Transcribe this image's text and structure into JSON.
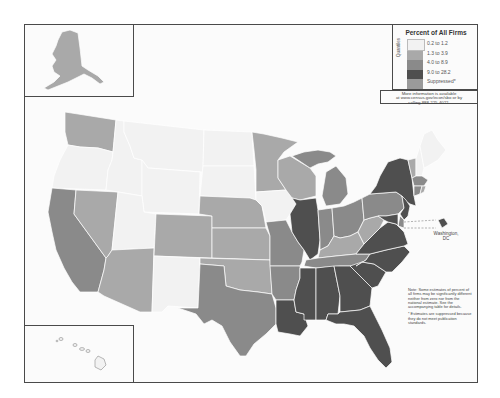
{
  "legend": {
    "title": "Percent of All Firms",
    "axis_label": "Quantiles",
    "classes": [
      {
        "label": "0.2 to 1.2",
        "color": "#f2f2f2"
      },
      {
        "label": "1.3 to 3.9",
        "color": "#a9a9a9"
      },
      {
        "label": "4.0 to 8.9",
        "color": "#8a8a8a"
      },
      {
        "label": "9.0 to 28.2",
        "color": "#4f4f4f"
      },
      {
        "label": "Suppressed*",
        "color": "#9a9a9a"
      }
    ]
  },
  "info_box": {
    "line1": "More information is available",
    "line2": "at www.census.gov/econ/sbo or by",
    "line3": "calling 888-225-4022."
  },
  "notes": {
    "note": "Note: Some estimates of percent of all firms may be significantly different neither from zero nor from the national estimate. See the accompanying table for details.",
    "suppressed": "* Estimates are suppressed because they do not meet publication standards."
  },
  "dc_label": {
    "line1": "Washington,",
    "line2": "DC"
  },
  "colors": {
    "class1": "#f2f2f2",
    "class2": "#a9a9a9",
    "class3": "#8a8a8a",
    "class4": "#4f4f4f",
    "border": "#ffffff",
    "frame": "#4a4a4a"
  },
  "states": {
    "WA": "1.3 to 3.9",
    "OR": "0.2 to 1.2",
    "CA": "4.0 to 8.9",
    "NV": "1.3 to 3.9",
    "ID": "0.2 to 1.2",
    "MT": "0.2 to 1.2",
    "WY": "0.2 to 1.2",
    "UT": "0.2 to 1.2",
    "AZ": "1.3 to 3.9",
    "CO": "1.3 to 3.9",
    "NM": "0.2 to 1.2",
    "ND": "0.2 to 1.2",
    "SD": "0.2 to 1.2",
    "NE": "1.3 to 3.9",
    "KS": "1.3 to 3.9",
    "OK": "1.3 to 3.9",
    "TX": "4.0 to 8.9",
    "MN": "1.3 to 3.9",
    "IA": "0.2 to 1.2",
    "MO": "4.0 to 8.9",
    "AR": "4.0 to 8.9",
    "LA": "9.0 to 28.2",
    "WI": "1.3 to 3.9",
    "IL": "9.0 to 28.2",
    "MI": "4.0 to 8.9",
    "IN": "4.0 to 8.9",
    "OH": "4.0 to 8.9",
    "KY": "1.3 to 3.9",
    "TN": "4.0 to 8.9",
    "MS": "9.0 to 28.2",
    "AL": "9.0 to 28.2",
    "GA": "9.0 to 28.2",
    "FL": "9.0 to 28.2",
    "SC": "9.0 to 28.2",
    "NC": "9.0 to 28.2",
    "VA": "9.0 to 28.2",
    "WV": "1.3 to 3.9",
    "PA": "4.0 to 8.9",
    "NY": "9.0 to 28.2",
    "VT": "1.3 to 3.9",
    "NH": "0.2 to 1.2",
    "ME": "0.2 to 1.2",
    "MA": "4.0 to 8.9",
    "CT": "4.0 to 8.9",
    "RI": "1.3 to 3.9",
    "NJ": "9.0 to 28.2",
    "DE": "4.0 to 8.9",
    "MD": "9.0 to 28.2",
    "DC": "9.0 to 28.2",
    "AK": "1.3 to 3.9",
    "HI": "0.2 to 1.2"
  }
}
